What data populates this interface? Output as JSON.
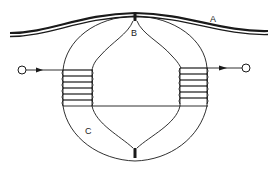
{
  "diagram": {
    "type": "magnetic recording head schematic",
    "labels": {
      "A": "A",
      "B": "B",
      "C": "C"
    },
    "parts": {
      "A": "recording tape / medium (wavy double strip across top)",
      "B": "head gap pole tip at top contacting strip",
      "C": "ring core with inner lens-shaped cut-out"
    },
    "coils": {
      "left_turns": 6,
      "right_turns": 6
    },
    "terminals": {
      "input": "left terminal with arrow pointing into left coil",
      "output": "right terminal with arrow pointing out of right coil"
    },
    "colors": {
      "ink": "#1a1a1a",
      "background": "#ffffff"
    }
  }
}
